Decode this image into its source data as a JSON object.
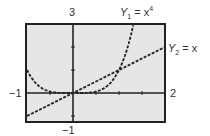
{
  "chart_data": {
    "type": "line",
    "title": "",
    "xlabel": "",
    "ylabel": "",
    "xlim": [
      -1,
      2
    ],
    "ylim": [
      -1,
      3
    ],
    "grid": false,
    "tick_labels": {
      "xmin": "−1",
      "xmax": "2",
      "ymin": "−1",
      "ymax": "3"
    },
    "series": [
      {
        "name": "Y1 = x^4",
        "label_main": "Y",
        "label_sub": "1",
        "label_rhs": "= x",
        "label_exp": "4",
        "style": "dashed"
      },
      {
        "name": "Y2 = x",
        "label_main": "Y",
        "label_sub": "2",
        "label_rhs": "= x",
        "style": "dashed"
      }
    ],
    "intersections": [
      [
        0,
        0
      ],
      [
        1,
        1
      ]
    ],
    "colors": {
      "screen": "#e6e6e6",
      "frame": "#222222",
      "curve": "#222222"
    }
  }
}
